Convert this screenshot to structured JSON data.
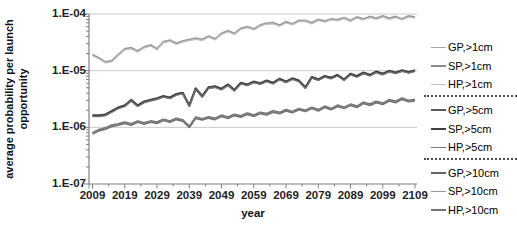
{
  "figure": {
    "background": "#ffffff"
  },
  "axes_colors": {
    "axis_line": "#808080",
    "gridline": "#c9c9c9",
    "tick_label": "#1f1f1f"
  },
  "y_axis_title_lines": [
    "average probability per launch",
    "opportunity"
  ],
  "chart_data": {
    "type": "line",
    "title": "",
    "xlabel": "year",
    "ylabel": "average probability per launch opportunity",
    "x_scale": "linear",
    "y_scale": "log",
    "xlim": [
      2009,
      2109
    ],
    "ylim": [
      1e-07,
      0.0001
    ],
    "grid": "horizontal-major-only",
    "legend_position": "right",
    "x_tick_labels": [
      "2009",
      "2019",
      "2029",
      "2039",
      "2049",
      "2059",
      "2069",
      "2079",
      "2089",
      "2099",
      "2109"
    ],
    "x_minor_tick_step_years": 5,
    "y_tick_labels": [
      "1.E-04",
      "1.E-05",
      "1.E-06",
      "1.E-07"
    ],
    "y_tick_values": [
      0.0001,
      1e-05,
      1e-06,
      1e-07
    ],
    "y_gridline_values": [
      0.0001,
      1e-05,
      1e-06
    ],
    "x": [
      2009,
      2011,
      2013,
      2015,
      2017,
      2019,
      2021,
      2023,
      2025,
      2027,
      2029,
      2031,
      2033,
      2035,
      2037,
      2039,
      2041,
      2043,
      2045,
      2047,
      2049,
      2051,
      2053,
      2055,
      2057,
      2059,
      2061,
      2063,
      2065,
      2067,
      2069,
      2071,
      2073,
      2075,
      2077,
      2079,
      2081,
      2083,
      2085,
      2087,
      2089,
      2091,
      2093,
      2095,
      2097,
      2099,
      2101,
      2103,
      2105,
      2107,
      2109
    ],
    "value_sets": {
      "gt1cm": [
        1.9e-05,
        1.66e-05,
        1.41e-05,
        1.48e-05,
        1.9e-05,
        2.4e-05,
        2.5e-05,
        2.2e-05,
        2.6e-05,
        2.8e-05,
        2.4e-05,
        3.2e-05,
        3.4e-05,
        3e-05,
        3.3e-05,
        3.5e-05,
        3.7e-05,
        3.5e-05,
        4e-05,
        3.6e-05,
        4.5e-05,
        5e-05,
        4.5e-05,
        5.5e-05,
        5.9e-05,
        5.4e-05,
        6.3e-05,
        6.8e-05,
        6.9e-05,
        6.3e-05,
        7.2e-05,
        6.6e-05,
        7.6e-05,
        7.6e-05,
        6.9e-05,
        7.9e-05,
        7.4e-05,
        8.1e-05,
        7.8e-05,
        8.5e-05,
        7.6e-05,
        8.7e-05,
        8.1e-05,
        8.9e-05,
        8.3e-05,
        9.1e-05,
        8.3e-05,
        8.9e-05,
        8.1e-05,
        9.1e-05,
        8.7e-05
      ],
      "gt5cm": [
        1.6e-06,
        1.6e-06,
        1.66e-06,
        1.9e-06,
        2.2e-06,
        2.4e-06,
        3e-06,
        2.4e-06,
        2.8e-06,
        3e-06,
        3.2e-06,
        3.5e-06,
        3.3e-06,
        3.8e-06,
        4e-06,
        2.4e-06,
        4.8e-06,
        3.5e-06,
        5e-06,
        5.2e-06,
        4.7e-06,
        5.6e-06,
        4.5e-06,
        6e-06,
        5.6e-06,
        6.3e-06,
        5.9e-06,
        6.6e-06,
        6e-06,
        7.1e-06,
        6.3e-06,
        7.2e-06,
        6.6e-06,
        5e-06,
        7.6e-06,
        6.9e-06,
        7.9e-06,
        7.4e-06,
        8.3e-06,
        6.9e-06,
        8.7e-06,
        7.9e-06,
        9.1e-06,
        8.3e-06,
        9.5e-06,
        8.7e-06,
        9.8e-06,
        9.1e-06,
        1e-05,
        9.3e-06,
        1e-05
      ],
      "gt10cm": [
        7.8e-07,
        8.9e-07,
        9.5e-07,
        1.07e-06,
        1.12e-06,
        1.2e-06,
        1.12e-06,
        1.26e-06,
        1.17e-06,
        1.26e-06,
        1.2e-06,
        1.35e-06,
        1.26e-06,
        1.41e-06,
        1.32e-06,
        1.02e-06,
        1.48e-06,
        1.38e-06,
        1.5e-06,
        1.41e-06,
        1.6e-06,
        1.48e-06,
        1.66e-06,
        1.55e-06,
        1.74e-06,
        1.6e-06,
        1.8e-06,
        1.7e-06,
        1.9e-06,
        1.78e-06,
        2e-06,
        1.86e-06,
        2.1e-06,
        1.95e-06,
        2.2e-06,
        2e-06,
        2.3e-06,
        2.1e-06,
        2.4e-06,
        2.2e-06,
        2.5e-06,
        2.3e-06,
        2.7e-06,
        2.5e-06,
        2.8e-06,
        2.6e-06,
        3e-06,
        2.8e-06,
        3.2e-06,
        2.9e-06,
        3e-06
      ]
    },
    "series": [
      {
        "name": "GP,>1cm",
        "values_ref": "gt1cm",
        "color": "#a6a6a6",
        "width": 1.2
      },
      {
        "name": "SP,>1cm",
        "values_ref": "gt1cm",
        "color": "#8c8c8c",
        "width": 1.2
      },
      {
        "name": "HP,>1cm",
        "values_ref": "gt1cm",
        "color": "#bfbfbf",
        "width": 1.4
      },
      {
        "name": "GP,>5cm",
        "values_ref": "gt5cm",
        "color": "#595959",
        "width": 1.6
      },
      {
        "name": "SP,>5cm",
        "values_ref": "gt5cm",
        "color": "#3f3f3f",
        "width": 2.2
      },
      {
        "name": "HP,>5cm",
        "values_ref": "gt5cm",
        "color": "#757575",
        "width": 1.3
      },
      {
        "name": "GP,>10cm",
        "values_ref": "gt10cm",
        "color": "#666666",
        "width": 1.6
      },
      {
        "name": "SP,>10cm",
        "values_ref": "gt10cm",
        "color": "#999999",
        "width": 1.2
      },
      {
        "name": "HP,>10cm",
        "values_ref": "gt10cm",
        "color": "#737373",
        "width": 1.6
      }
    ]
  }
}
